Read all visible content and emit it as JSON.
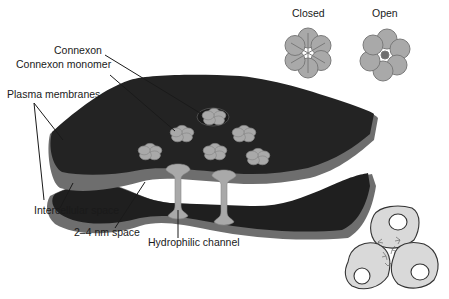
{
  "diagram": {
    "labels": {
      "connexon": "Connexon",
      "connexon_monomer": "Connexon monomer",
      "plasma_membranes": "Plasma membranes",
      "intercellular_space": "Intercellular space",
      "nm_space": "2–4 nm space",
      "hydrophilic_channel": "Hydrophilic channel"
    },
    "inset_states": {
      "closed": "Closed",
      "open": "Open"
    },
    "colors": {
      "membrane_dark": "#232323",
      "membrane_edge": "#6e6e6e",
      "connexon_fill": "#a9a9a9",
      "connexon_stroke": "#7a7a7a",
      "cell_fill": "#d9d9d9",
      "cell_stroke": "#333333",
      "label_text": "#1a1a1a"
    }
  }
}
